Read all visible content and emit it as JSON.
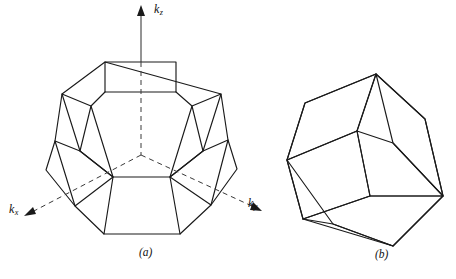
{
  "figure": {
    "domain": "diagram",
    "background_color": "#ffffff",
    "line_color": "#1a1a1a"
  },
  "axes": {
    "kz": {
      "label_base": "k",
      "label_sub": "z",
      "direction": "up",
      "line_style": "solid-above-origin, dashed-inside-body"
    },
    "kx": {
      "label_base": "k",
      "label_sub": "x",
      "direction": "down-left",
      "line_style": "dashed"
    },
    "ky": {
      "label_base": "k",
      "label_sub": "y",
      "direction": "down-right",
      "line_style": "dashed"
    }
  },
  "panels": [
    {
      "id": "a",
      "caption": "(a)",
      "shape_name": "truncated-octahedron"
    },
    {
      "id": "b",
      "caption": "(b)",
      "shape_name": "rhombic-dodecahedron"
    }
  ],
  "captions": {
    "a": "(a)",
    "b": "(b)"
  }
}
